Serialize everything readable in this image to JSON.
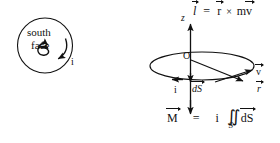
{
  "figure": {
    "background": "#ffffff",
    "ink": "#111111",
    "width": 280,
    "height": 143
  },
  "left_panel": {
    "name": "south-face-current-loop",
    "circle_label_line1": "south",
    "circle_label_line2": "face",
    "current_label": "i",
    "inner_symbol": "S-shaped current path with arrowheads"
  },
  "right_panel": {
    "axis_label_z": "z",
    "origin_label": "O",
    "current_label": "i",
    "area_element_label": "dS",
    "velocity_label": "v",
    "radius_label": "r",
    "angular_momentum": {
      "lhs": "l",
      "equals": "=",
      "rhs_r": "r",
      "cross": "×",
      "rhs_m": "m",
      "rhs_v": "v"
    },
    "magnetic_moment": {
      "lhs": "M",
      "equals": "=",
      "current": "i",
      "integral": "∬",
      "surface": "S",
      "element": "dS"
    }
  }
}
